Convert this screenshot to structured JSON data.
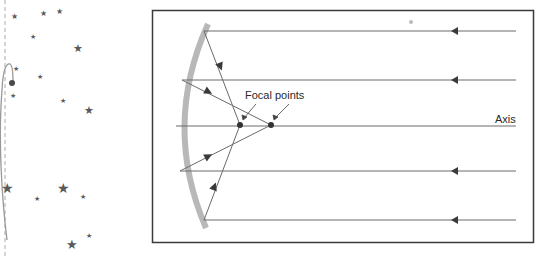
{
  "diagram": {
    "labels": {
      "focal_points": "Focal points",
      "axis": "Axis"
    },
    "colors": {
      "frame": "#3a3a3a",
      "ray": "#6a6a6a",
      "mirror": "#b8b8b8",
      "arrow": "#3a3a3a",
      "star": "#5a5a5a",
      "background": "#ffffff"
    },
    "incoming_rays_y": [
      31,
      80,
      126,
      171,
      220
    ],
    "focal_points": [
      {
        "x": 240,
        "y": 125
      },
      {
        "x": 271,
        "y": 125
      }
    ],
    "side_panel": {
      "description": "star field with comet-like curve and dashed vertical line"
    }
  }
}
